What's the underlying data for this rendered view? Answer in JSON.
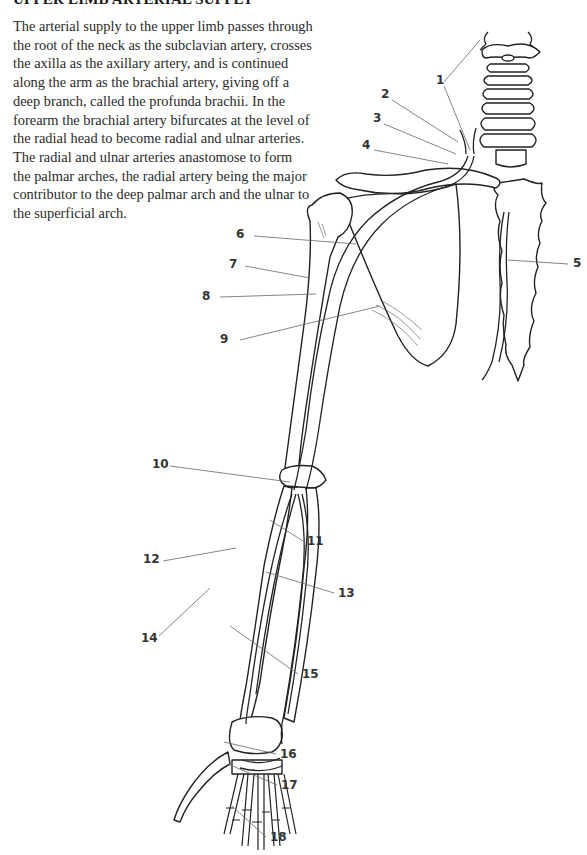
{
  "page": {
    "heading": "UPPER LIMB ARTERIAL SUPPLY",
    "paragraph": "The arterial supply to the upper limb passes through the root of the neck as the subclavian artery, crosses the axilla as the axillary artery, and is continued along the arm as the brachial artery, giving off a deep branch, called the profunda brachii. In the forearm the brachial artery bifurcates at the level of the radial head to become radial and ulnar arteries. The radial and ulnar arteries anastomose to form the palmar arches, the radial artery being the major contributor to the deep palmar arch and the ulnar to the superficial arch."
  },
  "diagram": {
    "labels": [
      {
        "num": "1",
        "x": 436,
        "y": 84
      },
      {
        "num": "2",
        "x": 381,
        "y": 98
      },
      {
        "num": "3",
        "x": 373,
        "y": 122
      },
      {
        "num": "4",
        "x": 362,
        "y": 149
      },
      {
        "num": "5",
        "x": 573,
        "y": 267
      },
      {
        "num": "6",
        "x": 236,
        "y": 238
      },
      {
        "num": "7",
        "x": 229,
        "y": 268
      },
      {
        "num": "8",
        "x": 202,
        "y": 300
      },
      {
        "num": "9",
        "x": 220,
        "y": 343
      },
      {
        "num": "10",
        "x": 152,
        "y": 468
      },
      {
        "num": "11",
        "x": 307,
        "y": 545
      },
      {
        "num": "12",
        "x": 143,
        "y": 563
      },
      {
        "num": "13",
        "x": 338,
        "y": 597
      },
      {
        "num": "14",
        "x": 141,
        "y": 642
      },
      {
        "num": "15",
        "x": 302,
        "y": 678
      },
      {
        "num": "16",
        "x": 280,
        "y": 758
      },
      {
        "num": "17",
        "x": 281,
        "y": 789
      },
      {
        "num": "18",
        "x": 270,
        "y": 841
      }
    ]
  }
}
